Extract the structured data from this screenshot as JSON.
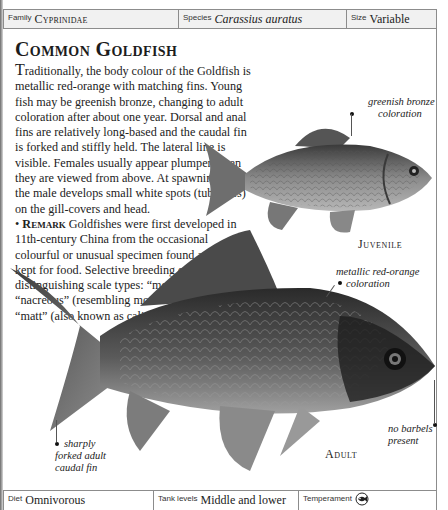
{
  "header": {
    "family_label": "Family",
    "family_value": "Cyprinidae",
    "species_label": "Species",
    "species_value": "Carassius auratus",
    "size_label": "Size",
    "size_value": "Variable"
  },
  "article": {
    "title": "Common Goldfish",
    "dropcap": "T",
    "paragraph_rest": "raditionally, the body colour of the Goldfish is metallic red-orange with matching fins. Young fish may be greenish bronze, changing to adult coloration after about one year. Dorsal and anal fins are relatively long-based and the caudal fin is forked and stiffly held. The lateral line is visible. Females usually appear plumper when they are viewed from above. At spawning time the male develops small white spots (tubercles) on the gill-covers and head.",
    "remark_bullet": "•",
    "remark_label": "Remark",
    "remark_text": "Goldfishes were first developed in 11th-century China from the occasional colourful or unusual specimen found among carp kept for food. Selective breeding established the distinguishing scale types: “metallic”, “nacreous” (resembling mother-of-pearl), and “matt” (also known as calico)."
  },
  "illustrations": {
    "juvenile": {
      "label": "Juvenile",
      "caption_line1": "greenish bronze",
      "caption_line2": "coloration"
    },
    "adult": {
      "label": "Adult",
      "caption_color_line1": "metallic red-orange",
      "caption_color_line2": "coloration",
      "caption_barbels_line1": "no barbels",
      "caption_barbels_line2": "present",
      "caption_fin_line1": "sharply",
      "caption_fin_line2": "forked adult",
      "caption_fin_line3": "caudal fin"
    }
  },
  "footer": {
    "diet_label": "Diet",
    "diet_value": "Omnivorous",
    "tank_label": "Tank levels",
    "tank_value": "Middle and lower",
    "temperament_label": "Temperament",
    "temperament_icon": "peaceful-fish-icon"
  },
  "colors": {
    "frame": "#8c8c8c",
    "header_bg": "#f1f1f1",
    "text": "#1a1a1a"
  }
}
